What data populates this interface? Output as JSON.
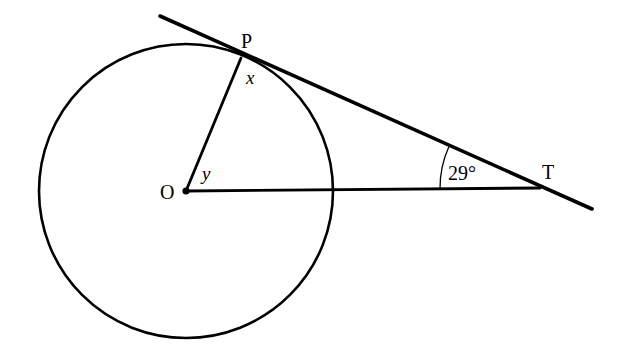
{
  "figure": {
    "background_color": "#ffffff",
    "stroke_color": "#000000",
    "labels": {
      "center": "O",
      "tangent_point": "P",
      "external_point": "T",
      "angle_at_p": "x",
      "angle_at_o": "y",
      "angle_at_t": "29°"
    }
  },
  "geometry": {
    "circle": {
      "cx": 186,
      "cy": 191,
      "r": 147
    },
    "center_dot": {
      "cx": 186,
      "cy": 191,
      "r": 3.6
    },
    "radius_OP": {
      "x1": 186,
      "y1": 191,
      "x2": 241,
      "y2": 58
    },
    "line_OT": {
      "x1": 186,
      "y1": 191,
      "x2": 540,
      "y2": 188
    },
    "tangent_line": {
      "x1": 160,
      "y1": 16,
      "x2": 592,
      "y2": 209
    },
    "angle_arc_T": {
      "cx": 540,
      "cy": 188,
      "r": 100
    }
  },
  "label_positions": {
    "center": {
      "x": 160,
      "y": 182
    },
    "tangent_point": {
      "x": 241,
      "y": 31
    },
    "external_point": {
      "x": 542,
      "y": 162
    },
    "angle_at_p": {
      "x": 246,
      "y": 68
    },
    "angle_at_o": {
      "x": 202,
      "y": 164
    },
    "angle_at_t": {
      "x": 448,
      "y": 163
    }
  }
}
